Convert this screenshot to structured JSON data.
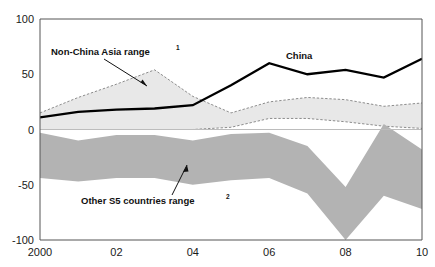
{
  "chart_data": {
    "type": "area",
    "title": "",
    "subtitle": "",
    "xlabel": "",
    "ylabel": "",
    "xlim": [
      2000,
      2010
    ],
    "ylim": [
      -100,
      100
    ],
    "x": [
      2000,
      2001,
      2002,
      2003,
      2004,
      2005,
      2006,
      2007,
      2008,
      2009,
      2010
    ],
    "x_tick_values": [
      2000,
      2002,
      2004,
      2006,
      2008,
      2010
    ],
    "x_tick_labels": [
      "2000",
      "02",
      "04",
      "06",
      "08",
      "10"
    ],
    "y_tick_values": [
      100,
      50,
      0,
      -50,
      -100
    ],
    "y_tick_labels": [
      "100",
      "50",
      "0",
      "-50",
      "-100"
    ],
    "grid": false,
    "zero_line": true,
    "legend_position": "inline-annotations",
    "series": [
      {
        "name": "China",
        "kind": "line",
        "style": "solid",
        "color": "#000000",
        "values": [
          11,
          16,
          18,
          19,
          22,
          40,
          60,
          50,
          54,
          47,
          64
        ]
      },
      {
        "name": "Non-China Asia range",
        "kind": "band",
        "style": "dashed-outline",
        "color": "#e3e3e3",
        "footnote": "1",
        "upper": [
          15,
          29,
          41,
          54,
          30,
          15,
          25,
          29,
          27,
          21,
          24
        ],
        "lower": [
          0,
          0,
          0,
          0,
          0,
          2,
          10,
          10,
          7,
          3,
          1
        ]
      },
      {
        "name": "Other S5 countries range",
        "kind": "band",
        "style": "solid-fill",
        "color": "#b3b3b3",
        "footnote": "2",
        "upper": [
          -3,
          -10,
          -5,
          -5,
          -10,
          -4,
          -3,
          -15,
          -52,
          5,
          -18
        ],
        "lower": [
          -44,
          -47,
          -44,
          -44,
          -50,
          -46,
          -44,
          -58,
          -100,
          -60,
          -72
        ]
      }
    ],
    "annotations": [
      {
        "name": "non-china-asia-range",
        "text": "Non-China Asia range",
        "sup": "1"
      },
      {
        "name": "china",
        "text": "China",
        "sup": ""
      },
      {
        "name": "other-s5-countries-range",
        "text": "Other S5 countries range",
        "sup": "2"
      }
    ]
  }
}
